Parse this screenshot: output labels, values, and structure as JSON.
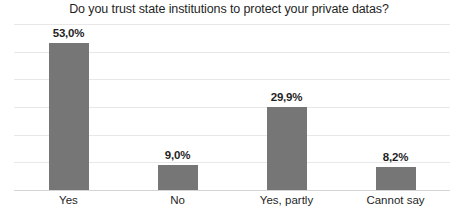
{
  "chart_data": {
    "type": "bar",
    "title": "Do you trust state institutions to protect your private datas?",
    "xlabel": "",
    "ylabel": "",
    "ylim": [
      0,
      60
    ],
    "grid": true,
    "legend": false,
    "legend_position": "none",
    "gridline_step": 10,
    "value_format": "comma-decimal-percent",
    "bar_color": "#767676",
    "gridline_color": "#e8e8e8",
    "axis_color": "#d4d4d4",
    "background_color": "#ffffff",
    "text_color": "#1f1f1f",
    "categories": [
      "Yes",
      "No",
      "Yes, partly",
      "Cannot say"
    ],
    "values": [
      53.0,
      9.0,
      29.9,
      8.2
    ],
    "value_labels": [
      "53,0%",
      "9,0%",
      "29,9%",
      "8,2%"
    ]
  }
}
